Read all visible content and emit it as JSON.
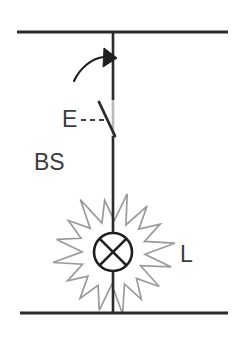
{
  "diagram": {
    "type": "electrical-circuit-schematic",
    "canvas": {
      "width": 247,
      "height": 344,
      "background": "#ffffff"
    },
    "colors": {
      "wire": "#2b2b2b",
      "wire_behind_switch": "#b9b9b9",
      "starburst": "#9a9a9a",
      "label": "#3c3c3c",
      "background": "#ffffff"
    },
    "rails": {
      "top": {
        "name": "top-supply-rail",
        "y": 32,
        "x_start": 17,
        "x_end": 228
      },
      "bottom": {
        "name": "bottom-supply-rail",
        "y": 313,
        "x_start": 20,
        "x_end": 228
      }
    },
    "wire": {
      "name": "vertical-wire",
      "x": 113,
      "y_start": 32,
      "y_end": 313
    },
    "arrow": {
      "name": "actuation-arrow",
      "description": "curved arrow indicating switch closing motion",
      "path": "M 74 81 C 80 68 92 58 104 57",
      "head_points": "104,48 117,58 103,67"
    },
    "switch": {
      "name": "switch-blade",
      "x1": 99,
      "y1": 102,
      "x2": 115,
      "y2": 136,
      "open": true
    },
    "labels": [
      {
        "name": "label-e",
        "text": "E",
        "x": 62,
        "y": 127
      },
      {
        "name": "label-bs",
        "text": "BS",
        "x": 34,
        "y": 170
      },
      {
        "name": "label-l",
        "text": "L",
        "x": 180,
        "y": 262
      }
    ],
    "leader_dashes": {
      "name": "e-leader-dashes",
      "x1": 81,
      "y1": 120,
      "x2": 106,
      "y2": 120,
      "dasharray": "5,4"
    },
    "lamp": {
      "name": "lamp-symbol",
      "label": "L",
      "center_x": 113,
      "center_y": 252,
      "radius": 19,
      "cross": true
    },
    "starburst": {
      "name": "lamp-glow-starburst",
      "center_x": 113,
      "center_y": 253,
      "points": 16,
      "outer_radius": 58,
      "inner_radius": 33,
      "rotation_deg": -9
    }
  }
}
